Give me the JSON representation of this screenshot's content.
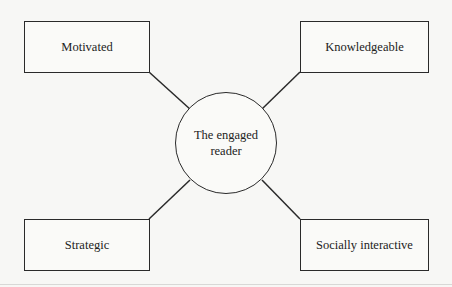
{
  "diagram": {
    "type": "hub-and-spoke",
    "center": {
      "line1": "The engaged",
      "line2": "reader"
    },
    "nodes": [
      {
        "id": "top-left",
        "label": "Motivated"
      },
      {
        "id": "top-right",
        "label": "Knowledgeable"
      },
      {
        "id": "bottom-left",
        "label": "Strategic"
      },
      {
        "id": "bottom-right",
        "label": "Socially interactive"
      }
    ],
    "colors": {
      "stroke": "#2a2a2a",
      "text": "#222222",
      "background": "#f7f7f5"
    }
  }
}
